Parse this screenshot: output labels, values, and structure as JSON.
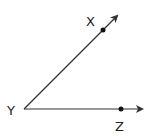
{
  "diagram": {
    "type": "angle",
    "name": "angle XYZ",
    "stroke_color": "#333333",
    "labels": {
      "x": "X",
      "y": "Y",
      "z": "Z"
    },
    "vertex": "Y",
    "rays": [
      {
        "from": "Y",
        "through": "X",
        "direction": "up-right"
      },
      {
        "from": "Y",
        "through": "Z",
        "direction": "right"
      }
    ],
    "points": [
      {
        "name": "X",
        "on_ray": "YX"
      },
      {
        "name": "Z",
        "on_ray": "YZ"
      }
    ]
  }
}
